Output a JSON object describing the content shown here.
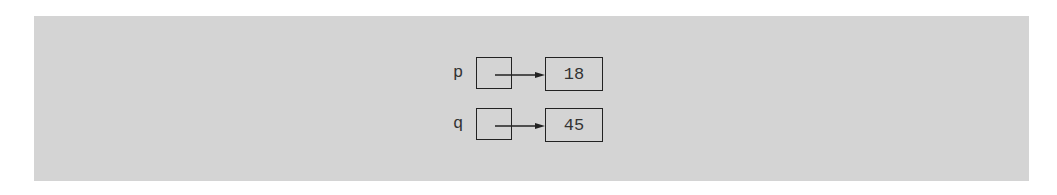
{
  "diagram": {
    "background_color": "#d4d4d4",
    "pointers": [
      {
        "name": "p",
        "value": "18"
      },
      {
        "name": "q",
        "value": "45"
      }
    ]
  }
}
